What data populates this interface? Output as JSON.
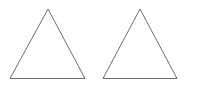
{
  "canvas": {
    "width": 218,
    "height": 90,
    "background_color": "#ffffff",
    "description": "Two outlined apex-up triangles side by side on a plain white background"
  },
  "style": {
    "stroke_color": "#6e6e6e",
    "stroke_width": 1,
    "fill": "none"
  },
  "shapes": [
    {
      "name": "triangle-left",
      "type": "triangle",
      "orientation": "apex-up",
      "apex": {
        "x": 48,
        "y": 9
      },
      "base_left": {
        "x": 10,
        "y": 78.5
      },
      "base_right": {
        "x": 85,
        "y": 78.5
      },
      "points": "48,9 85,78.5 10,78.5",
      "base_width": 75,
      "height": 69.5,
      "fill": "none",
      "stroke_color": "#6e6e6e",
      "stroke_width": 1,
      "label": ""
    },
    {
      "name": "triangle-right",
      "type": "triangle",
      "orientation": "apex-up",
      "apex": {
        "x": 140,
        "y": 9
      },
      "base_left": {
        "x": 103,
        "y": 78.5
      },
      "base_right": {
        "x": 177,
        "y": 78.5
      },
      "points": "140,9 177,78.5 103,78.5",
      "base_width": 74,
      "height": 69.5,
      "fill": "none",
      "stroke_color": "#6e6e6e",
      "stroke_width": 1,
      "label": ""
    }
  ],
  "labels": [],
  "text": []
}
